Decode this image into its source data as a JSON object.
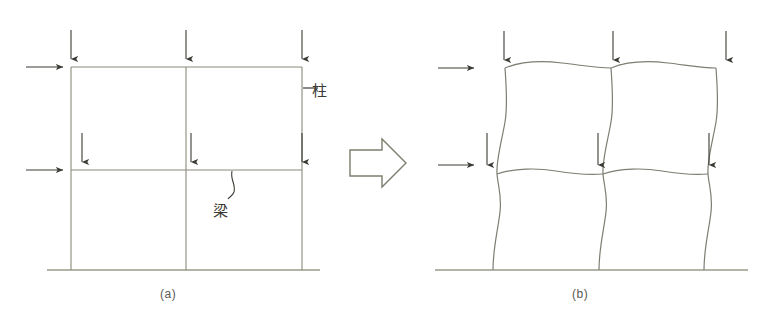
{
  "figure": {
    "background_color": "#ffffff",
    "line_color": "#8a8a7a",
    "arrow_color": "#3a3a34",
    "ground_color": "#9a9a8a",
    "text_color": "#5a5a52"
  },
  "panels": [
    {
      "id": "a",
      "caption": "(a)",
      "description": "Undeformed two-bay, two-story rigid frame",
      "annotations": [
        {
          "name": "column",
          "text": "柱",
          "leader": "dash"
        },
        {
          "name": "beam",
          "text": "梁",
          "leader": "curve"
        }
      ],
      "vertical_loads_top": 3,
      "vertical_loads_mid": 3,
      "lateral_loads": 2
    },
    {
      "id": "b",
      "caption": "(b)",
      "description": "Deformed frame showing lateral sway and flexural curvature",
      "annotations": [],
      "vertical_loads_top": 3,
      "vertical_loads_mid": 3,
      "lateral_loads": 2
    }
  ],
  "transition": {
    "name": "block-arrow-right",
    "symbol": "⇒"
  },
  "labels": {
    "column_label": "柱",
    "beam_label": "梁",
    "caption_a": "(a)",
    "caption_b": "(b)"
  }
}
